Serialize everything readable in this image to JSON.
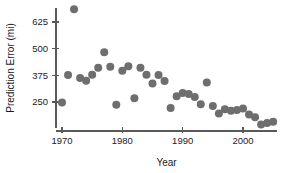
{
  "chart_data": {
    "type": "scatter",
    "title": "",
    "subtitle": "",
    "xlabel": "Year",
    "ylabel": "Prediction Error (mi)",
    "xlim": [
      1968.5,
      2006.5
    ],
    "ylim": [
      120,
      700
    ],
    "xticks": [
      1970,
      1980,
      1990,
      2000
    ],
    "xtick_labels": [
      "1970",
      "1980",
      "1990",
      "2000"
    ],
    "yticks": [
      250,
      375,
      500,
      625
    ],
    "ytick_labels": [
      "250",
      "375",
      "500",
      "625"
    ],
    "grid": false,
    "legend": false,
    "legend_position": "none",
    "marker": "circle",
    "marker_color": "#6e6e6e",
    "marker_size": 4.0,
    "x": [
      1970,
      1971,
      1972,
      1973,
      1974,
      1975,
      1976,
      1977,
      1978,
      1979,
      1980,
      1981,
      1982,
      1983,
      1984,
      1985,
      1986,
      1987,
      1988,
      1989,
      1990,
      1991,
      1992,
      1993,
      1994,
      1995,
      1996,
      1997,
      1998,
      1999,
      2000,
      2001,
      2002,
      2003,
      2004,
      2005
    ],
    "y": [
      248,
      377,
      685,
      363,
      350,
      378,
      410,
      483,
      415,
      237,
      397,
      418,
      268,
      411,
      378,
      337,
      377,
      348,
      222,
      277,
      292,
      288,
      273,
      240,
      341,
      231,
      196,
      216,
      209,
      212,
      220,
      191,
      178,
      145,
      152,
      158
    ],
    "points": [
      {
        "year": 1970,
        "error": 248
      },
      {
        "year": 1971,
        "error": 377
      },
      {
        "year": 1972,
        "error": 685
      },
      {
        "year": 1973,
        "error": 363
      },
      {
        "year": 1974,
        "error": 350
      },
      {
        "year": 1975,
        "error": 378
      },
      {
        "year": 1976,
        "error": 410
      },
      {
        "year": 1977,
        "error": 483
      },
      {
        "year": 1978,
        "error": 415
      },
      {
        "year": 1979,
        "error": 237
      },
      {
        "year": 1980,
        "error": 397
      },
      {
        "year": 1981,
        "error": 418
      },
      {
        "year": 1982,
        "error": 268
      },
      {
        "year": 1983,
        "error": 411
      },
      {
        "year": 1984,
        "error": 378
      },
      {
        "year": 1985,
        "error": 337
      },
      {
        "year": 1986,
        "error": 377
      },
      {
        "year": 1987,
        "error": 348
      },
      {
        "year": 1988,
        "error": 222
      },
      {
        "year": 1989,
        "error": 277
      },
      {
        "year": 1990,
        "error": 292
      },
      {
        "year": 1991,
        "error": 288
      },
      {
        "year": 1992,
        "error": 273
      },
      {
        "year": 1993,
        "error": 240
      },
      {
        "year": 1994,
        "error": 341
      },
      {
        "year": 1995,
        "error": 231
      },
      {
        "year": 1996,
        "error": 196
      },
      {
        "year": 1997,
        "error": 216
      },
      {
        "year": 1998,
        "error": 209
      },
      {
        "year": 1999,
        "error": 212
      },
      {
        "year": 2000,
        "error": 220
      },
      {
        "year": 2001,
        "error": 191
      },
      {
        "year": 2002,
        "error": 178
      },
      {
        "year": 2003,
        "error": 145
      },
      {
        "year": 2004,
        "error": 152
      },
      {
        "year": 2005,
        "error": 158
      }
    ]
  },
  "axes": {
    "x_title": "Year",
    "y_title": "Prediction Error (mi)",
    "axis_color": "#5a5a5a"
  },
  "colors": {
    "background": "#ffffff",
    "marker": "#6e6e6e",
    "axis": "#5a5a5a",
    "text": "#1a1a1a"
  }
}
